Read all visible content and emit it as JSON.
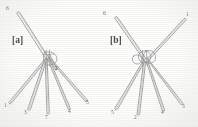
{
  "figure": {
    "background_color": "#fdfdfc",
    "ink_color": "#8a8a8a",
    "label_color": "#6b6b6b",
    "panels": [
      {
        "id": "a",
        "tag": "[a]",
        "hub": {
          "x": 48,
          "y": 57
        },
        "needles": [
          {
            "id": "1",
            "label": "1",
            "tip_x": 10,
            "tip_y": 104,
            "label_x": 6,
            "label_y": 107,
            "width": 3.4
          },
          {
            "id": "3",
            "label": "3",
            "tip_x": 29,
            "tip_y": 110,
            "label_x": 25,
            "label_y": 112,
            "width": 3.8
          },
          {
            "id": "7",
            "label": "7",
            "tip_x": 48,
            "tip_y": 114,
            "label_x": 45,
            "label_y": 116,
            "width": 3.6
          },
          {
            "id": "4",
            "label": "4",
            "tip_x": 69,
            "tip_y": 109,
            "label_x": 68,
            "label_y": 111,
            "width": 3.6
          },
          {
            "id": "5",
            "label": "5",
            "tip_x": 86,
            "tip_y": 101,
            "label_x": 86,
            "label_y": 103,
            "width": 3.4
          },
          {
            "id": "2",
            "label": "2",
            "tip_x": 56,
            "tip_y": 70,
            "label_x": 55,
            "label_y": 68,
            "width": 3.2
          },
          {
            "id": "6",
            "label": "6",
            "tip_x": 18,
            "tip_y": 12,
            "label_x": 15,
            "label_y": 8,
            "width": 3.6
          }
        ]
      },
      {
        "id": "b",
        "tag": "[b]",
        "hub": {
          "x": 47,
          "y": 60
        },
        "needles": [
          {
            "id": "5",
            "label": "5",
            "tip_x": 17,
            "tip_y": 110,
            "label_x": 13,
            "label_y": 113,
            "width": 3.6
          },
          {
            "id": "2",
            "label": "2",
            "tip_x": 39,
            "tip_y": 115,
            "label_x": 36,
            "label_y": 117,
            "width": 3.8
          },
          {
            "id": "4",
            "label": "4",
            "tip_x": 64,
            "tip_y": 111,
            "label_x": 63,
            "label_y": 113,
            "width": 3.6
          },
          {
            "id": "3",
            "label": "3",
            "tip_x": 82,
            "tip_y": 104,
            "label_x": 83,
            "label_y": 106,
            "width": 3.4
          },
          {
            "id": "6",
            "label": "6",
            "tip_x": 17,
            "tip_y": 17,
            "label_x": 13,
            "label_y": 13,
            "width": 3.6
          },
          {
            "id": "1",
            "label": "1",
            "tip_x": 84,
            "tip_y": 19,
            "label_x": 86,
            "label_y": 15,
            "width": 3.4
          }
        ]
      }
    ]
  }
}
